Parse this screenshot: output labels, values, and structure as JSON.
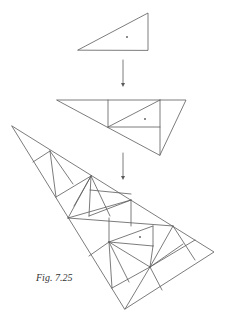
{
  "figure": {
    "caption": "Fig. 7.25",
    "stroke_color": "#5a5a5a",
    "dot_color": "#555555"
  },
  "diagram": {
    "stages": [
      {
        "name": "small-triangle",
        "polygons": [
          [
            [
              78,
              50
            ],
            [
              148,
              13
            ],
            [
              148,
              50
            ]
          ]
        ],
        "segments": [],
        "dots": [
          [
            127,
            37
          ]
        ]
      },
      {
        "name": "medium-triangle",
        "polygons": [
          [
            [
              57,
              100
            ],
            [
              186,
              100
            ],
            [
              160,
              155
            ]
          ]
        ],
        "segments": [
          [
            [
              108,
              100
            ],
            [
              108,
              127
            ]
          ],
          [
            [
              160,
              100
            ],
            [
              160,
              155
            ]
          ],
          [
            [
              108,
              127
            ],
            [
              160,
              100
            ]
          ],
          [
            [
              108,
              127
            ],
            [
              160,
              127
            ]
          ]
        ],
        "dots": [
          [
            145,
            119
          ]
        ]
      },
      {
        "name": "large-triangle",
        "polygons": [
          [
            [
              12,
              126
            ],
            [
              214,
              252
            ],
            [
              125,
              309
            ]
          ]
        ],
        "segments": [
          [
            [
              33,
              162
            ],
            [
              50,
              151
            ]
          ],
          [
            [
              50,
              151
            ],
            [
              56,
              197
            ]
          ],
          [
            [
              50,
              151
            ],
            [
              73,
              184
            ]
          ],
          [
            [
              56,
              197
            ],
            [
              91,
              176
            ]
          ],
          [
            [
              91,
              176
            ],
            [
              68,
              218
            ]
          ],
          [
            [
              91,
              176
            ],
            [
              89,
              216
            ]
          ],
          [
            [
              91,
              176
            ],
            [
              74,
              206
            ]
          ],
          [
            [
              91,
              176
            ],
            [
              110,
              216
            ]
          ],
          [
            [
              68,
              218
            ],
            [
              131,
              200
            ]
          ],
          [
            [
              90,
              190
            ],
            [
              131,
              194
            ]
          ],
          [
            [
              89,
              216
            ],
            [
              131,
              200
            ]
          ],
          [
            [
              131,
              200
            ],
            [
              131,
              226
            ]
          ],
          [
            [
              68,
              218
            ],
            [
              173,
              226
            ]
          ],
          [
            [
              109,
              218
            ],
            [
              109,
              242
            ]
          ],
          [
            [
              109,
              242
            ],
            [
              153,
              226
            ]
          ],
          [
            [
              109,
              242
            ],
            [
              153,
              246
            ]
          ],
          [
            [
              153,
              226
            ],
            [
              153,
              246
            ]
          ],
          [
            [
              109,
              242
            ],
            [
              89,
              256
            ]
          ],
          [
            [
              109,
              242
            ],
            [
              112,
              288
            ]
          ],
          [
            [
              109,
              242
            ],
            [
              129,
              282
            ]
          ],
          [
            [
              109,
              242
            ],
            [
              150,
              267
            ]
          ],
          [
            [
              112,
              288
            ],
            [
              150,
              267
            ]
          ],
          [
            [
              150,
              267
            ],
            [
              173,
              226
            ]
          ],
          [
            [
              150,
              267
            ],
            [
              153,
              246
            ]
          ],
          [
            [
              150,
              267
            ],
            [
              183,
              244
            ]
          ],
          [
            [
              150,
              267
            ],
            [
              195,
              240
            ]
          ],
          [
            [
              173,
              226
            ],
            [
              195,
              260
            ]
          ],
          [
            [
              150,
              267
            ],
            [
              162,
              290
            ]
          ],
          [
            [
              150,
              267
            ],
            [
              125,
              309
            ]
          ]
        ],
        "dots": [
          [
            140,
            237
          ]
        ]
      }
    ],
    "arrows": [
      {
        "name": "arrow-1",
        "from": [
          123,
          60
        ],
        "to": [
          123,
          87
        ]
      },
      {
        "name": "arrow-2",
        "from": [
          123,
          153
        ],
        "to": [
          123,
          180
        ]
      }
    ]
  }
}
